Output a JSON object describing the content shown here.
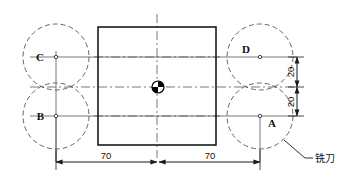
{
  "drawing": {
    "title": "",
    "colors": {
      "outline": "#1a1a1a",
      "construction": "#555555",
      "centerline": "#555555",
      "dimension": "#1a1a1a",
      "background": "#ffffff",
      "marker_fill": "#000000"
    },
    "part": {
      "name": "square-workpiece",
      "shape": "square",
      "left": 98,
      "top": 27,
      "right": 216,
      "bottom": 145
    },
    "center_marker": {
      "name": "workpiece-center-marker",
      "cx": 158,
      "cy": 87,
      "r": 6
    },
    "cutters": [
      {
        "label": "C",
        "name": "cutter-C",
        "cx": 56,
        "cy": 57,
        "r": 33,
        "label_x": 44,
        "label_y": 61,
        "label_anchor": "end"
      },
      {
        "label": "B",
        "name": "cutter-B",
        "cx": 56,
        "cy": 116,
        "r": 33,
        "label_x": 44,
        "label_y": 120,
        "label_anchor": "end"
      },
      {
        "label": "D",
        "name": "cutter-D",
        "cx": 260,
        "cy": 57,
        "r": 33,
        "label_x": 250,
        "label_y": 53,
        "label_anchor": "end"
      },
      {
        "label": "A",
        "name": "cutter-A",
        "cx": 260,
        "cy": 116,
        "r": 33,
        "label_x": 268,
        "label_y": 127,
        "label_anchor": "start"
      }
    ],
    "dimensions": {
      "horizontal": [
        {
          "name": "dim-70-left",
          "text": "70",
          "x1": 56,
          "x2": 157,
          "y": 162,
          "tx": 106,
          "ty": 159
        },
        {
          "name": "dim-70-right",
          "text": "70",
          "x1": 159,
          "x2": 260,
          "y": 162,
          "tx": 210,
          "ty": 159
        }
      ],
      "vertical": [
        {
          "name": "dim-20-upper",
          "text": "20",
          "y1": 57,
          "y2": 87,
          "x": 297,
          "tx": 294,
          "ty": 72
        },
        {
          "name": "dim-20-lower",
          "text": "20",
          "y1": 87,
          "y2": 116,
          "x": 297,
          "tx": 294,
          "ty": 102
        }
      ]
    },
    "leader": {
      "name": "cutter-leader",
      "label": "铣刀",
      "x1": 284,
      "y1": 140,
      "x2": 305,
      "y2": 158,
      "x3": 313,
      "y3": 158,
      "text_x": 315,
      "text_y": 162
    }
  }
}
